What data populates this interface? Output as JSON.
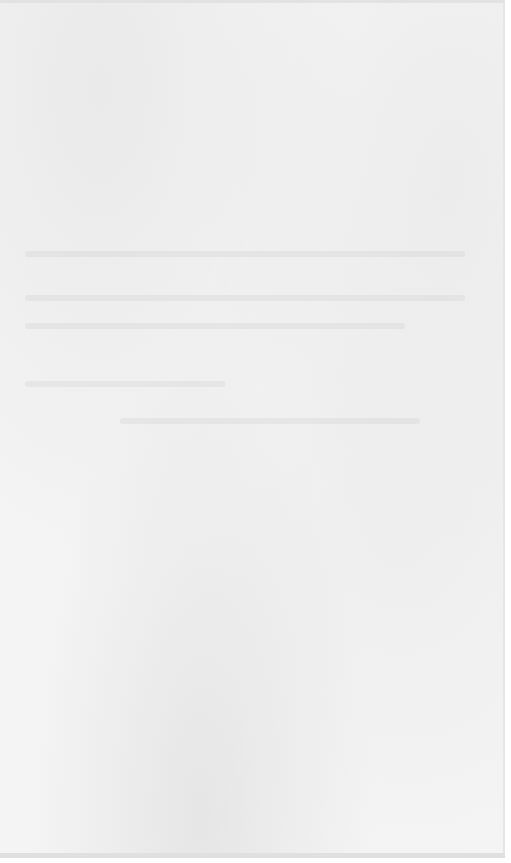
{
  "page": {
    "type": "blank scanned page",
    "paper_color": "#f4f4f4",
    "text": ""
  }
}
